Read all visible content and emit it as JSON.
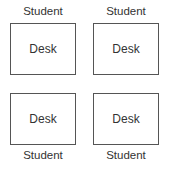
{
  "diagram": {
    "layout": "2x2 grid of desks, students facing outward",
    "desks": [
      {
        "label": "Desk",
        "student": "Student",
        "student_position": "top"
      },
      {
        "label": "Desk",
        "student": "Student",
        "student_position": "top"
      },
      {
        "label": "Desk",
        "student": "Student",
        "student_position": "bottom"
      },
      {
        "label": "Desk",
        "student": "Student",
        "student_position": "bottom"
      }
    ]
  }
}
